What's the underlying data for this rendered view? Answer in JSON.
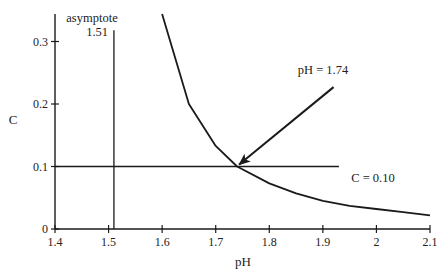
{
  "chart_data": {
    "type": "line",
    "title": "",
    "xlabel": "pH",
    "ylabel": "C",
    "xlim": [
      1.4,
      2.1
    ],
    "ylim": [
      0,
      0.345
    ],
    "grid": false,
    "legend": null,
    "xticks": [
      "1.4",
      "1.5",
      "1.6",
      "1.7",
      "1.8",
      "1.9",
      "2",
      "2.1"
    ],
    "yticks": [
      "0",
      "0.1",
      "0.2",
      "0.3"
    ],
    "series": [
      {
        "name": "C vs pH curve",
        "x": [
          1.6,
          1.65,
          1.7,
          1.74,
          1.8,
          1.85,
          1.9,
          1.95,
          2.0,
          2.05,
          2.1
        ],
        "y": [
          0.344,
          0.2,
          0.133,
          0.1,
          0.073,
          0.057,
          0.045,
          0.037,
          0.032,
          0.027,
          0.022
        ]
      }
    ],
    "reference_lines": [
      {
        "type": "vertical",
        "x": 1.51,
        "y_range": [
          0,
          0.318
        ],
        "label": "asymptote",
        "sublabel": "1.51"
      },
      {
        "type": "horizontal",
        "y": 0.1,
        "x_range": [
          1.4,
          1.93
        ],
        "label": "C = 0.10"
      }
    ],
    "annotations": [
      {
        "text": "pH = 1.74",
        "arrow_from": [
          1.92,
          0.227
        ],
        "arrow_to": [
          1.74,
          0.1
        ]
      }
    ]
  },
  "labels": {
    "asymptote": "asymptote",
    "asymptote_value": "1.51",
    "ph_annotation": "pH = 1.74",
    "c_annotation": "C = 0.10"
  },
  "colors": {
    "line": "#1a1a1a",
    "text": "#222222",
    "background": "#ffffff"
  }
}
